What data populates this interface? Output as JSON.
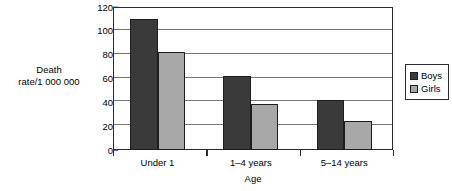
{
  "chart_data": {
    "type": "bar",
    "title": "",
    "subtitle": "",
    "xlabel": "Age",
    "ylabel": "Death rate/1 000 000",
    "ylabel_lines": [
      "Death",
      "rate/1 000 000"
    ],
    "categories": [
      "Under 1",
      "1–4 years",
      "5–14 years"
    ],
    "series": [
      {
        "name": "Boys",
        "values": [
          110,
          62,
          42
        ],
        "color": "#3a3a3a"
      },
      {
        "name": "Girls",
        "values": [
          82,
          39,
          24
        ],
        "color": "#a8a8a8"
      }
    ],
    "ylim": [
      0,
      120
    ],
    "ytick_step": 20,
    "yticks": [
      0,
      20,
      40,
      60,
      80,
      100,
      120
    ],
    "ytick_labels": [
      "0",
      "20",
      "40",
      "60",
      "80",
      "100",
      "120"
    ],
    "grid": "horizontal",
    "legend_position": "right-outside",
    "legend_entries": [
      "Boys",
      "Girls"
    ],
    "axis_color": "#2b2b2b",
    "gridline_color": "#767676",
    "background": "#ffffff"
  }
}
